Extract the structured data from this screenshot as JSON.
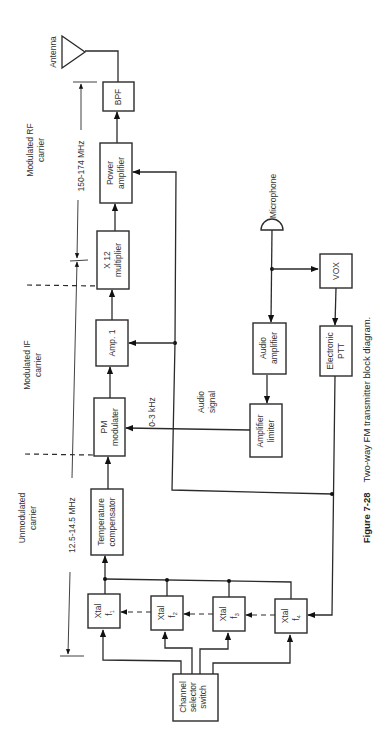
{
  "figure": {
    "number": "Figure 7-28",
    "title": "Two-way FM transmitter block diagram."
  },
  "blocks": {
    "bpf": [
      "BPF"
    ],
    "power_amp": [
      "Power",
      "amplifier"
    ],
    "multiplier": [
      "X 12",
      "multiplier"
    ],
    "amp1": [
      "Amp. 1"
    ],
    "pm_mod": [
      "PM",
      "modulater"
    ],
    "temp_comp": [
      "Temperature",
      "compensator"
    ],
    "xtal1": [
      "Xtal",
      "f",
      "1"
    ],
    "xtal2": [
      "Xtal",
      "f",
      "2"
    ],
    "xtal3": [
      "Xtal",
      "f",
      "3"
    ],
    "xtal4": [
      "Xtal",
      "f",
      "4"
    ],
    "channel_sel": [
      "Channel",
      "selector",
      "switch"
    ],
    "audio_amp": [
      "Audio",
      "amplifier"
    ],
    "amp_limiter": [
      "Amplifier",
      "limiter"
    ],
    "vox": [
      "VOX"
    ],
    "ptt": [
      "Electronic",
      "PTT"
    ]
  },
  "labels": {
    "antenna": "Antenna",
    "microphone": "Microphone",
    "rf_band": "150-174 MHz",
    "if_band": "12.5-14.5 MHz",
    "audio_band": "0-3 kHz",
    "audio_signal": [
      "Audio",
      "signal"
    ],
    "region_rf": [
      "Modulated RF",
      "carrier"
    ],
    "region_if": [
      "Modulated IF",
      "carrier"
    ],
    "region_unmod": [
      "Unmodulated",
      "carrier"
    ]
  }
}
